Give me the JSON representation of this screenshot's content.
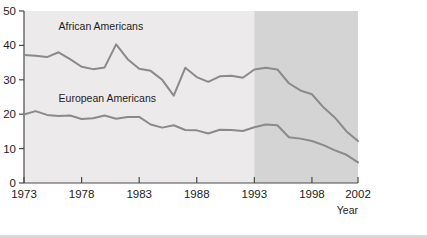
{
  "chart_data": {
    "type": "line",
    "title": "",
    "xlabel": "Year",
    "ylabel": "",
    "xlim": [
      1973,
      2002
    ],
    "ylim": [
      0,
      50
    ],
    "grid": false,
    "legend_position": "inline-labels",
    "x_ticks": [
      "1973",
      "1978",
      "1983",
      "1988",
      "1993",
      "1998",
      "2002"
    ],
    "x_tick_values": [
      1973,
      1978,
      1983,
      1988,
      1993,
      1998,
      2002
    ],
    "y_ticks": [
      "0",
      "10",
      "20",
      "30",
      "40",
      "50"
    ],
    "y_tick_values": [
      0,
      10,
      20,
      30,
      40,
      50
    ],
    "x": [
      1973,
      1974,
      1975,
      1976,
      1977,
      1978,
      1979,
      1980,
      1981,
      1982,
      1983,
      1984,
      1985,
      1986,
      1987,
      1988,
      1989,
      1990,
      1991,
      1992,
      1993,
      1994,
      1995,
      1996,
      1997,
      1998,
      1999,
      2000,
      2001,
      2002
    ],
    "series": [
      {
        "name": "African Americans",
        "color": "#8a8a8a",
        "values": [
          37.2,
          37.0,
          36.6,
          38.0,
          36.0,
          33.8,
          33.1,
          33.6,
          40.3,
          36.0,
          33.2,
          32.6,
          30.0,
          25.4,
          33.5,
          30.8,
          29.4,
          31.0,
          31.2,
          30.6,
          33.0,
          33.5,
          33.0,
          29.0,
          26.9,
          25.8,
          22.0,
          19.0,
          15.0,
          12.2
        ]
      },
      {
        "name": "European Americans",
        "color": "#8a8a8a",
        "values": [
          19.9,
          20.9,
          19.8,
          19.5,
          19.6,
          18.6,
          18.8,
          19.6,
          18.7,
          19.2,
          19.2,
          17.0,
          16.1,
          16.8,
          15.4,
          15.3,
          14.4,
          15.5,
          15.4,
          15.1,
          16.2,
          17.0,
          16.8,
          13.3,
          12.9,
          12.2,
          11.0,
          9.5,
          8.2,
          6.0
        ]
      }
    ],
    "annotations": [
      {
        "text": "African Americans",
        "x": 1976.0,
        "y": 44.5
      },
      {
        "text": "European Americans",
        "x": 1976.0,
        "y": 23.5
      }
    ],
    "shaded_regions": [
      {
        "name": "early-period",
        "x_start": 1973,
        "x_end": 1993,
        "color": "#eceaea"
      },
      {
        "name": "late-period",
        "x_start": 1993,
        "x_end": 2002,
        "color": "#d4d4d4"
      }
    ]
  },
  "axis": {
    "x_title": "Year"
  },
  "colors": {
    "line": "#8a8a8a",
    "axis": "#4a4a4a",
    "text": "#1c1c1c",
    "panel_light": "#eceaea",
    "panel_dark": "#d4d4d4",
    "page_background": "#ffffff",
    "bottom_rule": "#d8d8d8"
  }
}
